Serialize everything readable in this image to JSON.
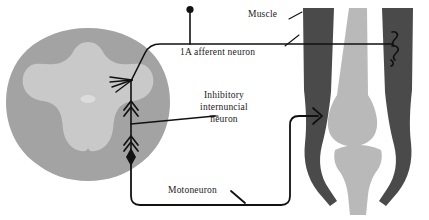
{
  "figure": {
    "background_color": "#ffffff",
    "ink_color": "#111111"
  },
  "labels": {
    "muscle": "Muscle",
    "afferent": "1A afferent neuron",
    "internuncial_line1": "Inhibitory",
    "internuncial_line2": "internuncial",
    "internuncial_line3": "neuron",
    "motoneuron": "Motoneuron"
  },
  "colors": {
    "white_matter": "#a3a3a3",
    "gray_matter": "#c9c9c9",
    "central_canal": "#dcdcdc",
    "muscle": "#4a4a4a",
    "bone": "#b9b9b9",
    "line": "#111111",
    "background": "#ffffff"
  },
  "structures": {
    "spinal_cord": "spinal-cord-cross-section",
    "white_matter": "white-matter",
    "gray_matter": "gray-matter-butterfly",
    "central_canal": "central-canal",
    "femur": "femur-bone",
    "tibia": "tibia-bone",
    "muscle_left": "muscle-belly-left",
    "muscle_right": "muscle-belly-right",
    "muscle_spindle": "muscle-spindle-receptor",
    "motor_endplate": "motor-endplate"
  },
  "neurons": {
    "afferent_path": "1A-afferent-neuron-path",
    "afferent_soma": "afferent-cell-body",
    "afferent_terminal": "afferent-dendrite-terminal",
    "internuncial_path": "inhibitory-internuncial-neuron-path",
    "motoneuron_path": "motoneuron-axon-path",
    "excitatory_synapse": "excitatory-synapse-arrowhead",
    "inhibitory_synapse": "inhibitory-synapse-diamond"
  }
}
